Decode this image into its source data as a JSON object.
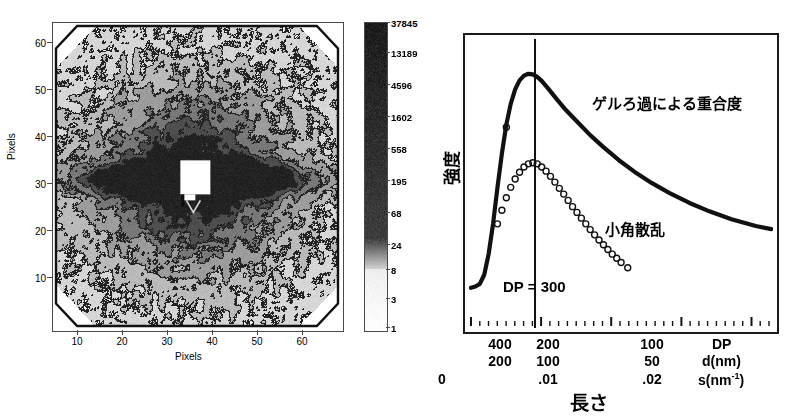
{
  "figure": {
    "panels": [
      "contour-scattering-pattern",
      "intensity-profile"
    ]
  },
  "left_panel": {
    "x_axis": {
      "label": "Pixels",
      "ticks": [
        "10",
        "20",
        "30",
        "40",
        "50",
        "60"
      ],
      "tick_values": [
        10,
        20,
        30,
        40,
        50,
        60
      ],
      "range": [
        0,
        65
      ]
    },
    "y_axis": {
      "label": "Pixels",
      "ticks": [
        "10",
        "20",
        "30",
        "40",
        "50",
        "60"
      ],
      "tick_values": [
        10,
        20,
        30,
        40,
        50,
        60
      ],
      "range": [
        0,
        65
      ]
    },
    "colorbar": {
      "labels": [
        "37845",
        "13189",
        "4596",
        "1602",
        "558",
        "195",
        "68",
        "24",
        "8",
        "3",
        "1"
      ],
      "values": [
        37845,
        13189,
        4596,
        1602,
        558,
        195,
        68,
        24,
        8,
        3,
        1
      ],
      "scale": "logarithmic",
      "colors": {
        "high": "#111111",
        "low": "#ffffff"
      }
    }
  },
  "chart_data": [
    {
      "type": "heatmap",
      "title": "",
      "xlabel": "Pixels",
      "ylabel": "Pixels",
      "xlim": [
        0,
        65
      ],
      "ylim": [
        0,
        65
      ],
      "colorbar_ticks": [
        1,
        3,
        8,
        24,
        68,
        195,
        558,
        1602,
        4596,
        13189,
        37845
      ],
      "colorbar_scale": "log",
      "notes": "octagonal detector mask, horizontal dark streak across center, white square beam-stop at ~ (31,32)",
      "beamstop": {
        "x": 31,
        "y": 32,
        "w": 5,
        "h": 6
      }
    },
    {
      "type": "line",
      "title": "",
      "xlabel": "長さ",
      "ylabel": "強度",
      "xlim": [
        0,
        0.027
      ],
      "ylim": [
        0,
        1
      ],
      "grid": false,
      "annotations": [
        {
          "text": "ゲルろ過による重合度",
          "x": 0.0145,
          "y": 0.78
        },
        {
          "text": "小角散乱",
          "x": 0.0145,
          "y": 0.27
        },
        {
          "text": "DP = 300",
          "x": 0.0045,
          "y": -0.12
        }
      ],
      "vline": {
        "x": 0.0058,
        "label": "DP = 300"
      },
      "series": [
        {
          "name": "ゲルろ過による重合度",
          "style": "thick-line",
          "x": [
            0.0,
            0.0004,
            0.0008,
            0.0012,
            0.0016,
            0.002,
            0.0024,
            0.0028,
            0.0032,
            0.0036,
            0.004,
            0.0044,
            0.0048,
            0.0052,
            0.0056,
            0.006,
            0.0064,
            0.007,
            0.0078,
            0.0086,
            0.0096,
            0.0108,
            0.012,
            0.0134,
            0.0148,
            0.0164,
            0.018,
            0.0198,
            0.0216,
            0.0236,
            0.0258,
            0.0272
          ],
          "y": [
            0.085,
            0.09,
            0.1,
            0.135,
            0.215,
            0.33,
            0.47,
            0.6,
            0.71,
            0.79,
            0.845,
            0.88,
            0.898,
            0.905,
            0.903,
            0.893,
            0.878,
            0.848,
            0.806,
            0.766,
            0.722,
            0.67,
            0.624,
            0.574,
            0.53,
            0.486,
            0.448,
            0.41,
            0.378,
            0.348,
            0.322,
            0.31
          ]
        },
        {
          "name": "小角散乱",
          "style": "open-circles",
          "x": [
            0.0024,
            0.0028,
            0.0032,
            0.0036,
            0.004,
            0.0044,
            0.0048,
            0.0052,
            0.0056,
            0.006,
            0.0064,
            0.0068,
            0.0072,
            0.0076,
            0.008,
            0.0084,
            0.0088,
            0.0092,
            0.0096,
            0.01,
            0.0104,
            0.0108,
            0.0112,
            0.0116,
            0.012,
            0.0124,
            0.0128,
            0.0132,
            0.0136,
            0.0142
          ],
          "y": [
            0.33,
            0.382,
            0.43,
            0.47,
            0.502,
            0.528,
            0.548,
            0.56,
            0.564,
            0.56,
            0.548,
            0.532,
            0.512,
            0.49,
            0.466,
            0.444,
            0.42,
            0.396,
            0.374,
            0.352,
            0.33,
            0.308,
            0.288,
            0.268,
            0.25,
            0.232,
            0.214,
            0.198,
            0.182,
            0.162
          ]
        },
        {
          "name": "ゲルろ過 stray marker",
          "style": "open-circles",
          "x": [
            0.0032
          ],
          "y": [
            0.7
          ]
        }
      ],
      "x_axis_rows": [
        {
          "label": "DP",
          "ticks": [
            {
              "text": "400",
              "x": 0.003
            },
            {
              "text": "200",
              "x": 0.0058
            },
            {
              "text": "100",
              "x": 0.0155
            },
            {
              "text": "",
              "x": 0
            }
          ]
        },
        {
          "label": "d(nm)",
          "ticks": [
            {
              "text": "200",
              "x": 0.003
            },
            {
              "text": "100",
              "x": 0.0058
            },
            {
              "text": "50",
              "x": 0.0155
            },
            {
              "text": "",
              "x": 0
            }
          ]
        },
        {
          "label": "s(nm⁻¹)",
          "ticks": [
            {
              "text": "0",
              "x": 0.0
            },
            {
              "text": ".01",
              "x": 0.01
            },
            {
              "text": ".02",
              "x": 0.02
            }
          ]
        }
      ]
    }
  ],
  "right_panel": {
    "y_axis_label": "強度",
    "x_axis_label": "長さ",
    "vline_label": "DP = 300",
    "curve_label": "ゲルろ過による重合度",
    "scatter_label": "小角散乱",
    "axis_rows": {
      "row1": {
        "name": "DP",
        "v1": "400",
        "v2": "200",
        "v3": "100"
      },
      "row2": {
        "name": "d(nm)",
        "v1": "200",
        "v2": "100",
        "v3": "50"
      },
      "row3": {
        "name_prefix": "s(nm",
        "name_sup": "-1",
        "name_suffix": ")",
        "v0": "0",
        "v2": ".01",
        "v3": ".02"
      }
    }
  }
}
